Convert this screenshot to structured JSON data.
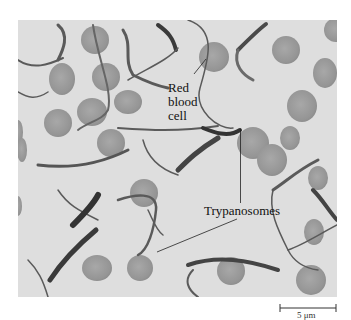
{
  "figure": {
    "type": "light micrograph",
    "labels": {
      "red_blood_cell": [
        "Red",
        "blood",
        "cell"
      ],
      "trypanosomes": "Trypanosomes"
    },
    "scale_bar": {
      "label": "5 μm"
    },
    "colors": {
      "background": "#dcdcdc",
      "rbc_fill": "#9a9a9a",
      "trypanosome": "#555555",
      "label_text": "#111111",
      "leader_line": "#222222"
    }
  }
}
